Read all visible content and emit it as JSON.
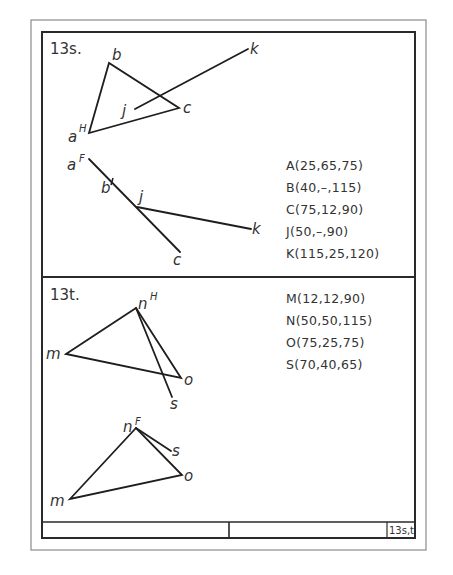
{
  "sheet": {
    "outer_frame": {
      "x": 31,
      "y": 20,
      "w": 395,
      "h": 530,
      "color": "#8a8a8a"
    },
    "inner_frame": {
      "x": 42,
      "y": 32,
      "w": 373,
      "h": 506,
      "color": "#2a2a2a"
    },
    "divider_y": 277,
    "title_block": {
      "top": 522,
      "mid_x": 229,
      "tag_x": 387,
      "tag": "13s,t"
    }
  },
  "problem_13s": {
    "number": "13s.",
    "top_view": {
      "points": {
        "a": {
          "label": "a",
          "sup": "H",
          "x": 89,
          "y": 133
        },
        "b": {
          "label": "b",
          "x": 109,
          "y": 63
        },
        "c": {
          "label": "c",
          "x": 179,
          "y": 108
        },
        "j": {
          "label": "j",
          "x": 135,
          "y": 109
        },
        "k": {
          "label": "k",
          "x": 248,
          "y": 49
        }
      }
    },
    "front_view": {
      "points": {
        "a": {
          "label": "a",
          "sup": "F",
          "x": 89,
          "y": 159
        },
        "b": {
          "label": "b",
          "x": 112,
          "y": 181
        },
        "j": {
          "label": "j",
          "x": 137,
          "y": 207
        },
        "c": {
          "label": "c",
          "x": 180,
          "y": 252
        },
        "k": {
          "label": "k",
          "x": 251,
          "y": 229
        }
      }
    },
    "coordinates": [
      "A(25,65,75)",
      "B(40,–,115)",
      "C(75,12,90)",
      "J(50,–,90)",
      "K(115,25,120)"
    ]
  },
  "problem_13t": {
    "number": "13t.",
    "top_view": {
      "points": {
        "n": {
          "label": "n",
          "sup": "H",
          "x": 136,
          "y": 308
        },
        "m": {
          "label": "m",
          "x": 66,
          "y": 354
        },
        "o": {
          "label": "o",
          "x": 181,
          "y": 378
        },
        "s": {
          "label": "s",
          "x": 172,
          "y": 397
        }
      }
    },
    "front_view": {
      "points": {
        "n": {
          "label": "n",
          "sup": "F",
          "x": 136,
          "y": 428
        },
        "s": {
          "label": "s",
          "x": 171,
          "y": 451
        },
        "o": {
          "label": "o",
          "x": 182,
          "y": 475
        },
        "m": {
          "label": "m",
          "x": 70,
          "y": 499
        }
      }
    },
    "coordinates": [
      "M(12,12,90)",
      "N(50,50,115)",
      "O(75,25,75)",
      "S(70,40,65)"
    ]
  }
}
